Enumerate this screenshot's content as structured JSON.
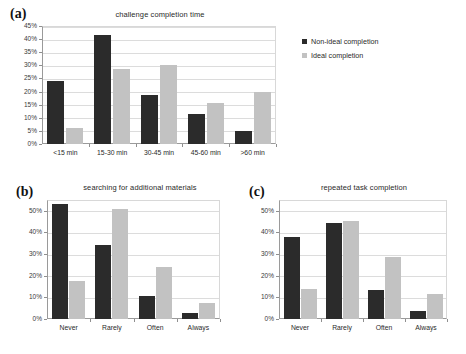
{
  "figure": {
    "background": "#ffffff",
    "series_colors": {
      "dark": "#2b2b2b",
      "light": "#c2c2c2"
    }
  },
  "panels": [
    {
      "letter": "(a)",
      "title": "challenge completion time",
      "has_legend": true
    },
    {
      "letter": "(b)",
      "title": "searching for additional materials",
      "has_legend": false
    },
    {
      "letter": "(c)",
      "title": "repeated task completion",
      "has_legend": false
    }
  ],
  "legend": {
    "entries": [
      {
        "label": "Non-ideal completion",
        "color": "#2b2b2b",
        "swatch": "square-dark-icon"
      },
      {
        "label": "Ideal completion",
        "color": "#c2c2c2",
        "swatch": "square-light-icon"
      }
    ]
  },
  "chart_data": [
    {
      "type": "bar",
      "panel": "(a)",
      "title": "challenge completion time",
      "xlabel": "",
      "ylabel": "",
      "categories": [
        "<15 min",
        "15-30 min",
        "30-45 min",
        "45-60 min",
        ">60 min"
      ],
      "series": [
        {
          "name": "Non-ideal completion",
          "color": "#2b2b2b",
          "values": [
            24,
            41.5,
            18.5,
            11.5,
            5
          ]
        },
        {
          "name": "Ideal completion",
          "color": "#c2c2c2",
          "values": [
            6,
            28.5,
            30,
            15.5,
            20
          ]
        }
      ],
      "ylim": [
        0,
        45
      ],
      "ytick_step": 5,
      "ytick_labels": [
        "0%",
        "5%",
        "10%",
        "15%",
        "20%",
        "25%",
        "30%",
        "35%",
        "40%",
        "45%"
      ],
      "grid": true,
      "legend_position": "right"
    },
    {
      "type": "bar",
      "panel": "(b)",
      "title": "searching for additional materials",
      "xlabel": "",
      "ylabel": "",
      "categories": [
        "Never",
        "Rarely",
        "Often",
        "Always"
      ],
      "series": [
        {
          "name": "Non-ideal completion",
          "color": "#2b2b2b",
          "values": [
            53,
            34,
            10.5,
            3
          ]
        },
        {
          "name": "Ideal completion",
          "color": "#c2c2c2",
          "values": [
            17.5,
            51,
            24,
            7.5
          ]
        }
      ],
      "ylim": [
        0,
        55
      ],
      "ytick_step": 10,
      "ytick_labels": [
        "0%",
        "10%",
        "20%",
        "30%",
        "40%",
        "50%"
      ],
      "grid": true,
      "legend_position": "none"
    },
    {
      "type": "bar",
      "panel": "(c)",
      "title": "repeated task completion",
      "xlabel": "",
      "ylabel": "",
      "categories": [
        "Never",
        "Rarely",
        "Often",
        "Always"
      ],
      "series": [
        {
          "name": "Non-ideal completion",
          "color": "#2b2b2b",
          "values": [
            38,
            44.5,
            13.5,
            3.5
          ]
        },
        {
          "name": "Ideal completion",
          "color": "#c2c2c2",
          "values": [
            14,
            45.5,
            28.5,
            11.5
          ]
        }
      ],
      "ylim": [
        0,
        55
      ],
      "ytick_step": 10,
      "ytick_labels": [
        "0%",
        "10%",
        "20%",
        "30%",
        "40%",
        "50%"
      ],
      "grid": true,
      "legend_position": "none"
    }
  ]
}
